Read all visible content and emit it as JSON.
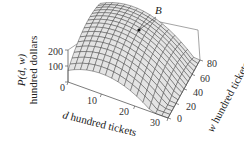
{
  "chart_data": {
    "type": "surface",
    "title": "",
    "zlabel": "P(d, w) hundred dollars",
    "zlabel_func": "P(d, w)",
    "zlabel_unit": "hundred dollars",
    "xlabel": "d hundred tickets",
    "xlabel_var": "d",
    "xlabel_unit": "hundred tickets",
    "ylabel": "w hundred tickets",
    "ylabel_var": "w",
    "ylabel_unit": "hundred tickets",
    "xlim": [
      0,
      30
    ],
    "ylim": [
      0,
      80
    ],
    "zlim": [
      0,
      200
    ],
    "x_ticks": [
      "0",
      "10",
      "20",
      "30"
    ],
    "y_ticks": [
      "0",
      "20",
      "40",
      "60",
      "80"
    ],
    "z_ticks": [
      "0",
      "100",
      "200"
    ],
    "annotations": [
      {
        "label": "B",
        "description": "maximum point on surface"
      }
    ],
    "surface_description": "concave-down paraboloid-like profit surface, mesh grid, peak near d≈10, w≈50",
    "grid": true
  },
  "labels": {
    "z_func": "P(d, w)",
    "z_unit": "hundred dollars",
    "x_var": "d",
    "x_unit": " hundred tickets",
    "y_var": "w",
    "y_unit": " hundred tickets",
    "point": "B",
    "x_ticks": [
      "0",
      "10",
      "20",
      "30"
    ],
    "y_ticks": [
      "0",
      "20",
      "40",
      "60",
      "80"
    ],
    "z_ticks": [
      "0",
      "100",
      "200"
    ]
  },
  "colors": {
    "surface_fill": "#e4e4e4",
    "mesh_line": "#3a3a3a",
    "box_line": "#555555",
    "marker": "#111111"
  }
}
